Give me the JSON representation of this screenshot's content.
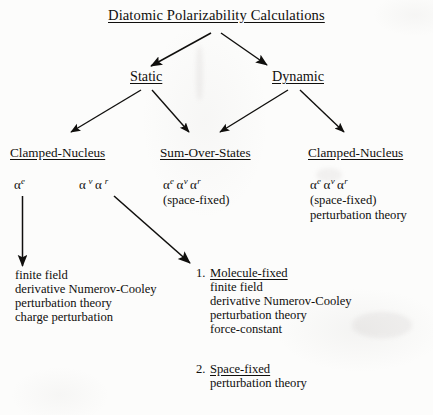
{
  "diagram": {
    "title": "Diatomic Polarizability Calculations",
    "level1": {
      "static": "Static",
      "dynamic": "Dynamic"
    },
    "level2": {
      "clamped_nucleus_left": "Clamped-Nucleus",
      "sum_over_states": "Sum-Over-States",
      "clamped_nucleus_right": "Clamped-Nucleus"
    },
    "formulas": {
      "alpha": "α",
      "alpha_e_left": {
        "symbol": "α",
        "sup": "e"
      },
      "alpha_v_left": {
        "symbol": "α",
        "sup": "v"
      },
      "alpha_r_left": {
        "symbol": "α",
        "sup": "r"
      },
      "sos_line": "αe αv αr",
      "sos_note": "(space-fixed)",
      "right_line": "αe αv αr",
      "right_note": "(space-fixed)",
      "right_method": "perturbation theory"
    },
    "leaf_left": {
      "lines": [
        "finite field",
        "derivative Numerov-Cooley",
        "perturbation theory",
        "charge perturbation"
      ]
    },
    "leaf_molecule_fixed": {
      "number": "1.",
      "heading": "Molecule-fixed",
      "lines": [
        "finite field",
        "derivative Numerov-Cooley",
        "perturbation theory",
        "force-constant"
      ]
    },
    "leaf_space_fixed": {
      "number": "2.",
      "heading": "Space-fixed",
      "lines": [
        "perturbation theory"
      ]
    },
    "colors": {
      "ink": "#100f0d",
      "paper": "#fcfcfb"
    }
  }
}
